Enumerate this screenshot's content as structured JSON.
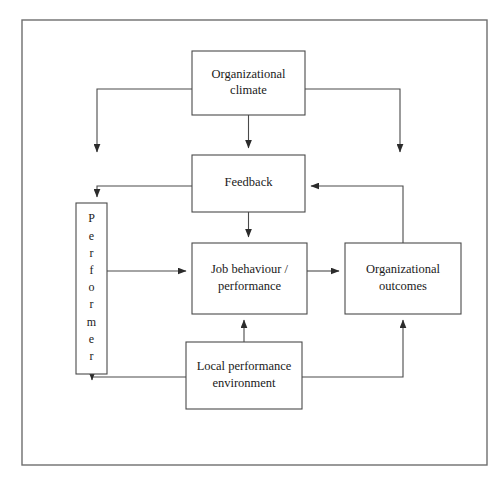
{
  "diagram": {
    "frame": {
      "x": 22,
      "y": 20,
      "width": 465,
      "height": 445
    },
    "colors": {
      "box_stroke": "#4a4a4a",
      "frame_stroke": "#6e6e6e",
      "box_fill": "#ffffff",
      "line": "#4a4a4a",
      "text": "#1a1a1a",
      "background": "#ffffff"
    },
    "nodes": [
      {
        "id": "organizational-climate",
        "label": "Organizational climate",
        "lines": [
          "Organizational",
          "climate"
        ],
        "x": 192,
        "y": 51,
        "width": 113,
        "height": 64,
        "orientation": "horizontal"
      },
      {
        "id": "feedback",
        "label": "Feedback",
        "lines": [
          "Feedback"
        ],
        "x": 192,
        "y": 155,
        "width": 113,
        "height": 57,
        "orientation": "horizontal"
      },
      {
        "id": "performer",
        "label": "Performer",
        "letters": [
          "P",
          "e",
          "r",
          "f",
          "o",
          "r",
          "m",
          "e",
          "r"
        ],
        "x": 76,
        "y": 203,
        "width": 31,
        "height": 171,
        "orientation": "vertical"
      },
      {
        "id": "job-behaviour-performance",
        "label": "Job behaviour / performance",
        "lines": [
          "Job behaviour /",
          "performance"
        ],
        "x": 192,
        "y": 243,
        "width": 115,
        "height": 71,
        "orientation": "horizontal"
      },
      {
        "id": "organizational-outcomes",
        "label": "Organizational outcomes",
        "lines": [
          "Organizational",
          "outcomes"
        ],
        "x": 345,
        "y": 243,
        "width": 116,
        "height": 71,
        "orientation": "horizontal"
      },
      {
        "id": "local-performance-environment",
        "label": "Local performance environment",
        "lines": [
          "Local performance",
          "environment"
        ],
        "x": 186,
        "y": 342,
        "width": 116,
        "height": 67,
        "orientation": "horizontal"
      }
    ],
    "edges": [
      {
        "id": "climate-to-feedback",
        "from": "organizational-climate",
        "to": "feedback",
        "path": "M 248.5 115 L 248.5 148",
        "arrow": true
      },
      {
        "id": "climate-left-branch-down",
        "from": "organizational-climate",
        "to": "left-channel",
        "path": "M 192 89 L 97 89 L 97 152",
        "arrow": true
      },
      {
        "id": "climate-right-branch-down",
        "from": "organizational-climate",
        "to": "right-channel",
        "path": "M 305 89 L 400 89 L 400 152",
        "arrow": true
      },
      {
        "id": "feedback-to-performer",
        "from": "feedback",
        "to": "performer",
        "path": "M 192 186 L 97 186 L 97 197",
        "arrow": true
      },
      {
        "id": "feedback-to-job-behaviour",
        "from": "feedback",
        "to": "job-behaviour-performance",
        "path": "M 248.5 212 L 248.5 237",
        "arrow": true
      },
      {
        "id": "performer-to-job-behaviour",
        "from": "performer",
        "to": "job-behaviour-performance",
        "path": "M 107 271 L 186 271",
        "arrow": true
      },
      {
        "id": "job-behaviour-to-outcomes",
        "from": "job-behaviour-performance",
        "to": "organizational-outcomes",
        "path": "M 307 271 L 339 271",
        "arrow": true
      },
      {
        "id": "outcomes-to-feedback",
        "from": "organizational-outcomes",
        "to": "feedback",
        "path": "M 403 243 L 403 186 L 311 186",
        "arrow": true
      },
      {
        "id": "local-env-to-job-behaviour",
        "from": "local-performance-environment",
        "to": "job-behaviour-performance",
        "path": "M 244 342 L 244 320",
        "arrow": true
      },
      {
        "id": "local-env-to-performer",
        "from": "local-performance-environment",
        "to": "performer",
        "path": "M 186 377 L 92 377 L 92 380",
        "arrow": true
      },
      {
        "id": "local-env-to-outcomes",
        "from": "local-performance-environment",
        "to": "organizational-outcomes",
        "path": "M 302 377 L 403 377 L 403 320",
        "arrow": true
      }
    ]
  }
}
